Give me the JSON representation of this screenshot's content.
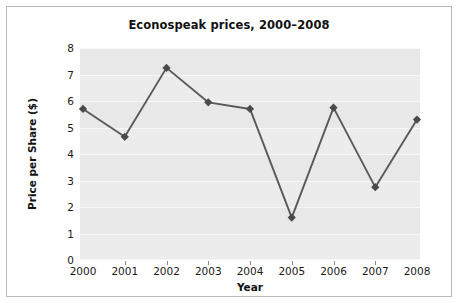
{
  "chart_data": {
    "type": "line",
    "title": "Econospeak prices, 2000–2008",
    "xlabel": "Year",
    "ylabel": "Price per Share ($)",
    "categories": [
      "2000",
      "2001",
      "2002",
      "2003",
      "2004",
      "2005",
      "2006",
      "2007",
      "2008"
    ],
    "values": [
      5.7,
      4.65,
      7.25,
      5.95,
      5.7,
      1.6,
      5.75,
      2.75,
      5.3
    ],
    "series": [
      {
        "name": "Price per Share",
        "values": [
          5.7,
          4.65,
          7.25,
          5.95,
          5.7,
          1.6,
          5.75,
          2.75,
          5.3
        ]
      }
    ],
    "ylim": [
      0,
      8
    ],
    "y_ticks": [
      "0",
      "1",
      "2",
      "3",
      "4",
      "5",
      "6",
      "7",
      "8"
    ],
    "x_ticks": [
      "2000",
      "2001",
      "2002",
      "2003",
      "2004",
      "2005",
      "2006",
      "2007",
      "2008"
    ],
    "grid": true,
    "legend": false,
    "legend_position": "none",
    "marker": "diamond",
    "colors": {
      "line": "#595959",
      "marker": "#4a4a4a",
      "plot_background": "#ececec",
      "gridline": "#f8f8f8",
      "figure_background": "#ffffff",
      "text": "#111111",
      "border": "#b9b9b9"
    }
  }
}
